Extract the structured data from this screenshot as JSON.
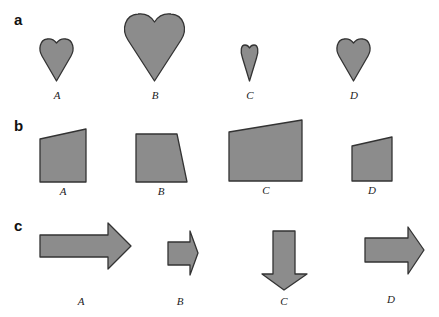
{
  "colors": {
    "fill": "#8c8c8c",
    "stroke": "#333333",
    "background": "#ffffff"
  },
  "panels": [
    {
      "id": "a",
      "label": "a",
      "shape_type": "heart",
      "items": [
        {
          "label": "A"
        },
        {
          "label": "B"
        },
        {
          "label": "C"
        },
        {
          "label": "D"
        }
      ]
    },
    {
      "id": "b",
      "label": "b",
      "shape_type": "quadrilateral",
      "items": [
        {
          "label": "A"
        },
        {
          "label": "B"
        },
        {
          "label": "C"
        },
        {
          "label": "D"
        }
      ]
    },
    {
      "id": "c",
      "label": "c",
      "shape_type": "arrow",
      "items": [
        {
          "label": "A",
          "direction": "right"
        },
        {
          "label": "B",
          "direction": "right"
        },
        {
          "label": "C",
          "direction": "down"
        },
        {
          "label": "D",
          "direction": "right"
        }
      ]
    }
  ]
}
